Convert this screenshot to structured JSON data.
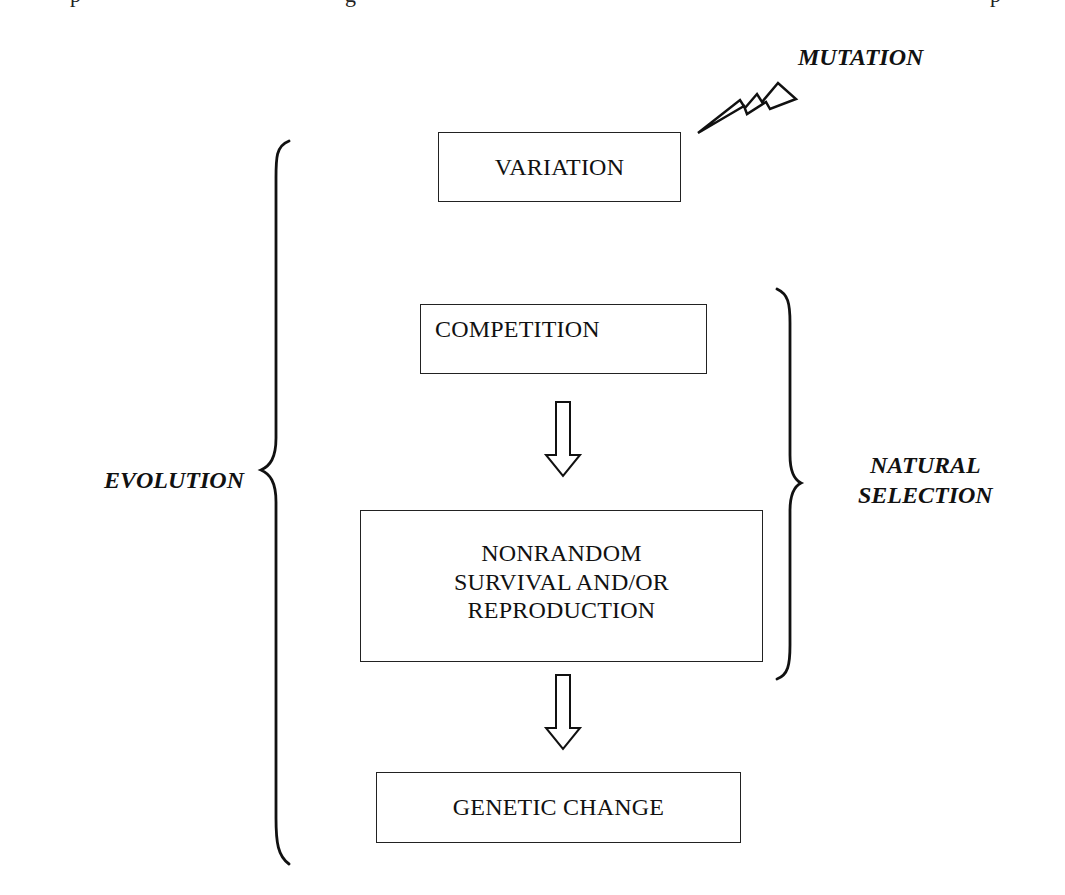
{
  "page_fragment": {
    "top_text_cut": "p    g    p"
  },
  "diagram": {
    "title_annotations": {
      "mutation": "MUTATION",
      "evolution": "EVOLUTION",
      "natural_selection_line1": "NATURAL",
      "natural_selection_line2": "SELECTION"
    },
    "nodes": [
      {
        "id": "variation",
        "label": "VARIATION"
      },
      {
        "id": "competition",
        "label": "COMPETITION"
      },
      {
        "id": "nonrandom",
        "label_line1": "NONRANDOM",
        "label_line2": "SURVIVAL AND/OR",
        "label_line3": "REPRODUCTION"
      },
      {
        "id": "genetic_change",
        "label": "GENETIC CHANGE"
      }
    ],
    "edges": [
      {
        "from": "competition",
        "to": "nonrandom",
        "style": "hollow-down-arrow"
      },
      {
        "from": "nonrandom",
        "to": "genetic_change",
        "style": "hollow-down-arrow"
      }
    ],
    "icons": {
      "mutation": "lightning-bolt-icon",
      "evolution_bracket": "left-curly-brace",
      "selection_bracket": "right-curly-brace"
    },
    "colors": {
      "stroke": "#222222",
      "shadow": "#8a8a8a",
      "background": "#ffffff"
    }
  }
}
